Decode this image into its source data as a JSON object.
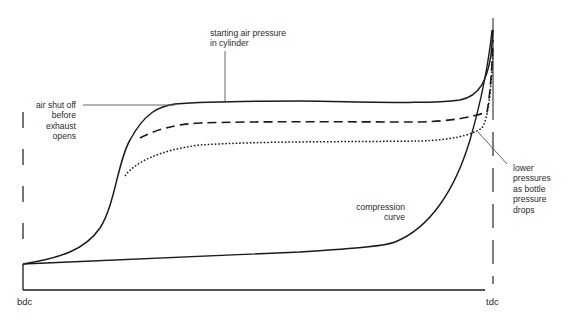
{
  "diagram": {
    "type": "engine indicator diagram (pressure vs stroke) for air starting",
    "axis": {
      "left_label": "bdc",
      "right_label": "tdc"
    },
    "annotations": {
      "starting_air_pressure": "starting air pressure\nin cylinder",
      "air_shut_off": "air shut off\nbefore\nexhaust\nopens",
      "lower_pressures": "lower\npressures\nas bottle\npressure\ndrops",
      "compression_curve": "compression\ncurve"
    },
    "curves": [
      {
        "name": "starting air pressure (full)",
        "style": "solid"
      },
      {
        "name": "lower bottle pressure 1",
        "style": "dashed"
      },
      {
        "name": "lower bottle pressure 2",
        "style": "dotted"
      },
      {
        "name": "compression curve",
        "style": "solid"
      }
    ],
    "colors": {
      "line": "#1a1a1a",
      "leader": "#555555",
      "background": "#ffffff"
    }
  }
}
